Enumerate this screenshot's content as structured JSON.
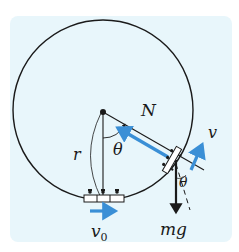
{
  "diagram": {
    "background_color": "#e8f6fb",
    "accent_color": "#3a8fd6",
    "line_color": "#1a1a1a",
    "labels": {
      "normal_force": "N",
      "angle": "θ",
      "angle_at_car": "θ",
      "radius": "r",
      "velocity": "v",
      "initial_velocity": "v",
      "initial_velocity_sub": "0",
      "gravity": "mg"
    },
    "elements": [
      {
        "name": "loop-circle",
        "type": "circle",
        "center": [
          103,
          110
        ],
        "radius": 90
      },
      {
        "name": "center-point",
        "type": "dot"
      },
      {
        "name": "radius-line",
        "type": "line",
        "label": "r"
      },
      {
        "name": "angle-theta",
        "type": "arc-arrow",
        "label": "θ"
      },
      {
        "name": "normal-force-arrow",
        "type": "arrow",
        "color": "#3a8fd6",
        "label": "N"
      },
      {
        "name": "velocity-arrow",
        "type": "arrow",
        "color": "#3a8fd6",
        "label": "v"
      },
      {
        "name": "gravity-arrow",
        "type": "arrow",
        "color": "#1a1a1a",
        "label": "mg"
      },
      {
        "name": "initial-velocity-arrow",
        "type": "arrow",
        "color": "#3a8fd6",
        "label": "v0"
      },
      {
        "name": "car-bottom",
        "type": "car"
      },
      {
        "name": "car-side",
        "type": "car"
      }
    ]
  }
}
